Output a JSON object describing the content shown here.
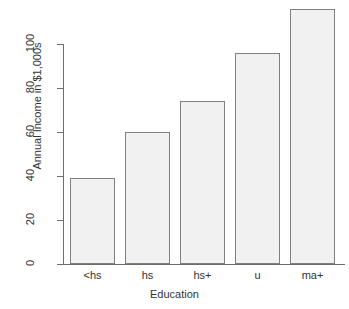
{
  "chart_data": {
    "type": "bar",
    "title": "",
    "xlabel": "Education",
    "ylabel": "Annual Income in $1,000s",
    "categories": [
      "<hs",
      "hs",
      "hs+",
      "u",
      "ma+"
    ],
    "values": [
      39,
      60,
      74,
      96,
      116
    ],
    "yticks": [
      0,
      20,
      40,
      60,
      80,
      100
    ],
    "ylim": [
      0,
      120
    ],
    "grid": false,
    "legend": null,
    "bar_fill_color": "#f1f1f1",
    "bar_border_color": "#808080",
    "axis_color": "#6d6d6d",
    "text_color": "#333333",
    "background_color": "#ffffff"
  },
  "cropped_text": {
    "top_fragment": ""
  }
}
